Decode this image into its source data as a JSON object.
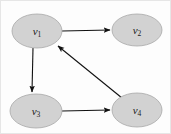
{
  "figure": {
    "width": 171,
    "height": 134,
    "background_color": "#fdfdfd",
    "border_color": "#e6e6e6"
  },
  "style": {
    "node_fill": "#d2d2d2",
    "node_stroke": "#a8a8a8",
    "edge_color": "#111111",
    "label_color": "#1a1a1a"
  },
  "graph_data": {
    "type": "directed-graph",
    "node_shape": "ellipse",
    "nodes": [
      {
        "id": "v1",
        "base": "v",
        "subscript": "1",
        "cx": 37,
        "cy": 31,
        "rx": 25,
        "ry": 17
      },
      {
        "id": "v2",
        "base": "v",
        "subscript": "2",
        "cx": 137,
        "cy": 30,
        "rx": 25,
        "ry": 16
      },
      {
        "id": "v3",
        "base": "v",
        "subscript": "3",
        "cx": 36,
        "cy": 111,
        "rx": 26,
        "ry": 17
      },
      {
        "id": "v4",
        "base": "v",
        "subscript": "4",
        "cx": 137,
        "cy": 110,
        "rx": 25,
        "ry": 17
      }
    ],
    "edges": [
      {
        "id": "e1",
        "from": "v1",
        "to": "v2",
        "direction": "right",
        "arrow": true
      },
      {
        "id": "e2",
        "from": "v1",
        "to": "v3",
        "direction": "down",
        "arrow": true
      },
      {
        "id": "e3",
        "from": "v3",
        "to": "v4",
        "direction": "right",
        "arrow": true
      },
      {
        "id": "e4",
        "from": "v4",
        "to": "v1",
        "direction": "up-left",
        "arrow": true
      }
    ]
  }
}
